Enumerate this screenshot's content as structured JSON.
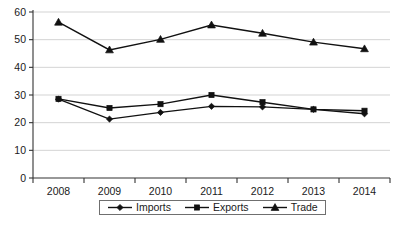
{
  "chart_data": {
    "type": "line",
    "title": "",
    "xlabel": "",
    "ylabel": "",
    "categories": [
      "2008",
      "2009",
      "2010",
      "2011",
      "2012",
      "2013",
      "2014"
    ],
    "ylim": [
      0,
      60
    ],
    "ytick_step": 10,
    "yticks": [
      "0",
      "10",
      "20",
      "30",
      "40",
      "50",
      "60"
    ],
    "grid": true,
    "grid_axis": "y",
    "legend_position": "bottom",
    "series": [
      {
        "name": "Imports",
        "marker": "diamond",
        "color": "#111111",
        "values": [
          28.5,
          21.3,
          23.7,
          25.9,
          25.7,
          24.8,
          23.2
        ]
      },
      {
        "name": "Exports",
        "marker": "square",
        "color": "#111111",
        "values": [
          28.6,
          25.3,
          26.7,
          30.0,
          27.4,
          24.8,
          24.3
        ]
      },
      {
        "name": "Trade",
        "marker": "triangle",
        "color": "#111111",
        "values": [
          56.3,
          46.3,
          50.1,
          55.3,
          52.3,
          49.1,
          46.7
        ]
      }
    ]
  },
  "caption": {
    "text": ""
  }
}
